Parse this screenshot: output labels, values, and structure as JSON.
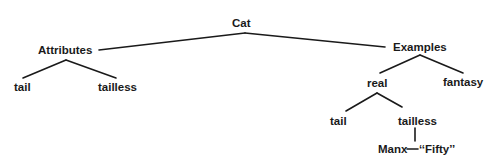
{
  "diagram": {
    "type": "tree",
    "colors": {
      "ink": "#1a1a1a",
      "background": "#ffffff"
    },
    "root": {
      "label": "Cat",
      "children": [
        {
          "label": "Attributes",
          "children": [
            {
              "label": "tail"
            },
            {
              "label": "tailless"
            }
          ]
        },
        {
          "label": "Examples",
          "children": [
            {
              "label": "real",
              "children": [
                {
                  "label": "tail"
                },
                {
                  "label": "tailless",
                  "children": [
                    {
                      "label": "Manx",
                      "note": "“Fifty”"
                    }
                  ]
                }
              ]
            },
            {
              "label": "fantasy"
            }
          ]
        }
      ]
    },
    "labels": {
      "cat": "Cat",
      "attributes": "Attributes",
      "attr_tail": "tail",
      "attr_tailless": "tailless",
      "examples": "Examples",
      "real": "real",
      "fantasy": "fantasy",
      "real_tail": "tail",
      "real_tailless": "tailless",
      "manx": "Manx",
      "fifty": "‘‘Fifty’’"
    }
  }
}
